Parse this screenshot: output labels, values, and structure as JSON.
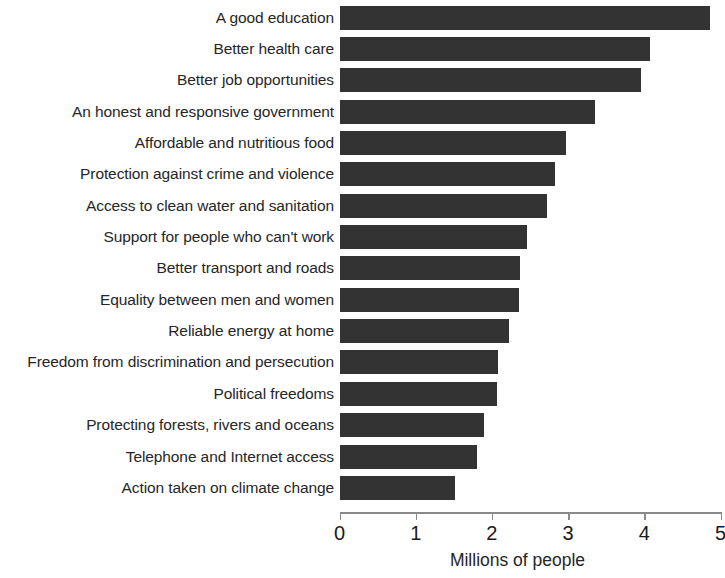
{
  "chart_data": {
    "type": "bar",
    "orientation": "horizontal",
    "title": "",
    "xlabel": "Millions of people",
    "ylabel": "",
    "xlim": [
      0,
      5
    ],
    "xticks": [
      "0",
      "1",
      "2",
      "3",
      "4",
      "5"
    ],
    "grid": false,
    "legend": false,
    "bar_color": "#333333",
    "text_color": "#262626",
    "background": "#ffffff",
    "categories": [
      "A good education",
      "Better health care",
      "Better job opportunities",
      "An honest and responsive government",
      "Affordable and nutritious food",
      "Protection against crime and violence",
      "Access to clean water and sanitation",
      "Support for people who can't work",
      "Better transport and roads",
      "Equality between men and women",
      "Reliable energy at home",
      "Freedom from discrimination and persecution",
      "Political freedoms",
      "Protecting forests, rivers and oceans",
      "Telephone and Internet access",
      "Action taken on climate change"
    ],
    "values": [
      4.86,
      4.08,
      3.96,
      3.35,
      2.97,
      2.83,
      2.72,
      2.46,
      2.37,
      2.36,
      2.22,
      2.08,
      2.07,
      1.9,
      1.8,
      1.52
    ]
  }
}
